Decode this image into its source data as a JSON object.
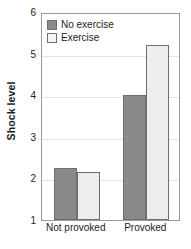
{
  "chart_data": {
    "type": "bar",
    "title": "",
    "subtitle": "",
    "xlabel": "",
    "ylabel": "Shock level",
    "categories": [
      "Not provoked",
      "Provoked"
    ],
    "series": [
      {
        "name": "No exercise",
        "color": "#8a8a8a",
        "values": [
          2.25,
          4.0
        ]
      },
      {
        "name": "Exercise",
        "color": "#ededed",
        "values": [
          2.15,
          5.2
        ]
      }
    ],
    "ylim": [
      1,
      6
    ],
    "yticks": [
      1,
      2,
      3,
      4,
      5,
      6
    ],
    "ytick_labels": [
      "1",
      "2",
      "3",
      "4",
      "5",
      "6"
    ],
    "grid": true,
    "grid_axis": "y",
    "legend_position": "top-left",
    "annotations": []
  },
  "legend": {
    "entries": [
      {
        "label": "No exercise",
        "swatch": "legend-swatch-no-exercise"
      },
      {
        "label": "Exercise",
        "swatch": "legend-swatch-exercise"
      }
    ]
  },
  "colors": {
    "series_dark": "#8a8a8a",
    "series_light": "#ededed",
    "bar_outline": "#6e6e6e",
    "frame": "#9a9a9a",
    "gridline": "#e3e3e3",
    "text": "#1c1c1c",
    "background": "#ffffff"
  }
}
